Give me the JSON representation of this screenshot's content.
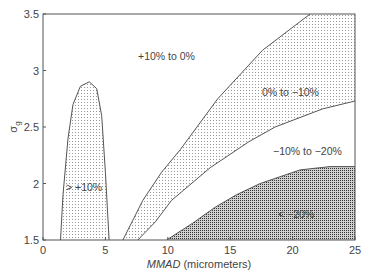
{
  "chart_data": {
    "type": "area",
    "title": "",
    "xlabel": "MMAD (micrometers)",
    "xlabel_italic": "MMAD",
    "xlabel_rest": " (micrometers)",
    "ylabel": "σg",
    "xlim": [
      0,
      25
    ],
    "ylim": [
      1.5,
      3.5
    ],
    "xticks": [
      0,
      5,
      10,
      15,
      20,
      25
    ],
    "yticks": [
      1.5,
      2,
      2.5,
      3,
      3.5
    ],
    "xtick_labels": [
      "0",
      "5",
      "10",
      "15",
      "20",
      "25"
    ],
    "ytick_labels": [
      "1.5",
      "2",
      "2.5",
      "3",
      "3.5"
    ],
    "grid": false,
    "regions": [
      {
        "name": "> +10%",
        "fill": "light-dot",
        "label_pos": [
          4.0,
          2.12
        ]
      },
      {
        "name": "+10% to 0%",
        "fill": "none",
        "label_pos": [
          10.5,
          3.1
        ]
      },
      {
        "name": "0% to −10%",
        "fill": "light-dot",
        "label_pos": [
          19.5,
          2.85
        ]
      },
      {
        "name": "−10% to −20%",
        "fill": "none",
        "label_pos": [
          21.0,
          2.4
        ]
      },
      {
        "name": "< −20%",
        "fill": "dense-dot",
        "label_pos": [
          19.5,
          1.8
        ]
      }
    ],
    "boundaries": {
      "plus10_lobe": [
        [
          1.4,
          1.5
        ],
        [
          1.6,
          1.9
        ],
        [
          2.0,
          2.4
        ],
        [
          2.4,
          2.7
        ],
        [
          3.0,
          2.86
        ],
        [
          3.7,
          2.9
        ],
        [
          4.3,
          2.84
        ],
        [
          4.7,
          2.6
        ],
        [
          5.0,
          2.1
        ],
        [
          5.3,
          1.5
        ]
      ],
      "zero_pct": [
        [
          6.4,
          1.5
        ],
        [
          8.0,
          1.85
        ],
        [
          9.5,
          2.1
        ],
        [
          11.0,
          2.3
        ],
        [
          14.0,
          2.75
        ],
        [
          17.6,
          3.18
        ],
        [
          21.4,
          3.5
        ]
      ],
      "minus10_pct": [
        [
          7.6,
          1.5
        ],
        [
          9.0,
          1.66
        ],
        [
          10.3,
          1.85
        ],
        [
          13.4,
          2.14
        ],
        [
          16.5,
          2.37
        ],
        [
          18.6,
          2.5
        ],
        [
          22.4,
          2.66
        ],
        [
          25.0,
          2.73
        ]
      ],
      "minus20_pct": [
        [
          9.9,
          1.5
        ],
        [
          12.0,
          1.65
        ],
        [
          13.8,
          1.79
        ],
        [
          15.5,
          1.9
        ],
        [
          17.4,
          2.0
        ],
        [
          20.6,
          2.12
        ],
        [
          23.0,
          2.15
        ],
        [
          25.0,
          2.15
        ]
      ]
    }
  },
  "labels": {
    "region_plus10": "> +10%",
    "region_10_0": "+10% to 0%",
    "region_0_m10": "0% to −10%",
    "region_m10_m20": "−10% to −20%",
    "region_m20": "< −20%",
    "ylabel_sigma": "σ",
    "ylabel_sub": "g"
  }
}
